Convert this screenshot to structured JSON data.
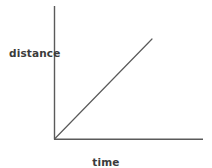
{
  "figure": {
    "background_color": "#ffffff",
    "width": 212,
    "height": 168
  },
  "chart_data": {
    "type": "line",
    "title": "",
    "subtitle": "",
    "xlabel": "time",
    "ylabel": "distance",
    "grid": false,
    "legend": null,
    "axis_color": "#5a5a5a",
    "line_color": "#5a5a5a",
    "text_color": "#3b3b3b",
    "xlim": [
      0,
      1
    ],
    "ylim": [
      0,
      1
    ],
    "xticks": [],
    "yticks": [],
    "xticklabels": [],
    "yticklabels": [],
    "annotations": [],
    "series": [
      {
        "name": "distance vs time",
        "x": [
          0,
          1
        ],
        "y": [
          0,
          1
        ],
        "slope": 1,
        "intercept": 0,
        "description": "straight line through the origin with constant positive slope"
      }
    ]
  },
  "axes": {
    "y_axis": {
      "name": "distance-axis",
      "orientation": "vertical",
      "x": 54,
      "y_top": 6,
      "y_bottom": 139,
      "arrow": false
    },
    "x_axis": {
      "name": "time-axis",
      "orientation": "horizontal",
      "y": 139,
      "x_left": 54,
      "x_right": 203,
      "arrow": false
    },
    "origin": {
      "x": 54,
      "y": 139
    }
  },
  "data_line": {
    "start": {
      "x": 54,
      "y": 139
    },
    "end": {
      "x": 152,
      "y": 39
    },
    "stroke_width": 1.2
  },
  "labels": {
    "y_axis_label": "distance",
    "x_axis_label": "time"
  }
}
